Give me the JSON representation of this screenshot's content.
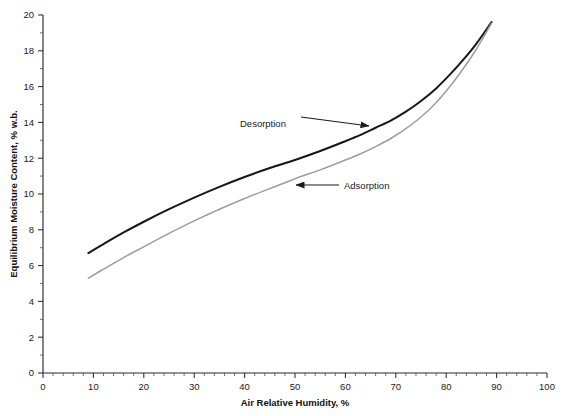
{
  "chart_data": {
    "type": "line",
    "title": "",
    "xlabel": "Air Relative Humidity, %",
    "ylabel": "Equilibrium Moisture Content, % w.b.",
    "xlim": [
      0,
      100
    ],
    "ylim": [
      0,
      20
    ],
    "grid": false,
    "legend_position": "none",
    "x_ticks": [
      0,
      10,
      20,
      30,
      40,
      50,
      60,
      70,
      80,
      90,
      100
    ],
    "x_tick_labels": [
      "0",
      "10",
      "20",
      "30",
      "40",
      "50",
      "60",
      "70",
      "80",
      "90",
      "100"
    ],
    "x_minor_step": 2,
    "y_ticks": [
      0,
      2,
      4,
      6,
      8,
      10,
      12,
      14,
      16,
      18,
      20
    ],
    "y_tick_labels": [
      "0",
      "2",
      "4",
      "6",
      "8",
      "10",
      "12",
      "14",
      "16",
      "18",
      "20"
    ],
    "y_minor_step": 1,
    "series": [
      {
        "name": "Desorption",
        "color": "#171717",
        "width": 2.0,
        "x": [
          9.0,
          12,
          16,
          20,
          25,
          30,
          35,
          40,
          45,
          50,
          55,
          60,
          63,
          66,
          69,
          72,
          75,
          78,
          81,
          84,
          86,
          89.0
        ],
        "values": [
          6.7,
          7.2,
          7.85,
          8.45,
          9.15,
          9.8,
          10.4,
          10.95,
          11.45,
          11.9,
          12.4,
          12.95,
          13.3,
          13.7,
          14.1,
          14.6,
          15.2,
          15.9,
          16.75,
          17.7,
          18.4,
          19.6
        ]
      },
      {
        "name": "Adsorption",
        "color": "#9d9d9d",
        "width": 1.5,
        "x": [
          9.0,
          12,
          16,
          20,
          25,
          30,
          35,
          40,
          45,
          50,
          55,
          60,
          63,
          66,
          69,
          72,
          75,
          78,
          81,
          84,
          86,
          89.0
        ],
        "values": [
          5.3,
          5.8,
          6.45,
          7.05,
          7.8,
          8.5,
          9.15,
          9.75,
          10.3,
          10.85,
          11.35,
          11.9,
          12.25,
          12.65,
          13.1,
          13.65,
          14.3,
          15.1,
          16.1,
          17.25,
          18.1,
          19.55
        ]
      }
    ],
    "annotations": [
      {
        "label": "Desorption",
        "text_x": 240,
        "text_y": 127,
        "arrow_x1": 301,
        "arrow_y1": 117,
        "arrow_x2": 369,
        "arrow_y2": 126,
        "direction": "right"
      },
      {
        "label": "Adsorption",
        "text_x": 344,
        "text_y": 189,
        "arrow_x1": 339,
        "arrow_y1": 185,
        "arrow_x2": 296,
        "arrow_y2": 185,
        "direction": "left"
      }
    ],
    "colors": {
      "axis": "#2b2b2b",
      "text": "#1a1a1a",
      "background": "#ffffff",
      "desorption": "#171717",
      "adsorption": "#9d9d9d"
    }
  }
}
